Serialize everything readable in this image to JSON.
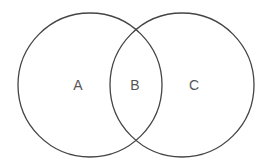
{
  "diagram": {
    "type": "venn",
    "stroke_color": "#444444",
    "label_color": "#555555",
    "circles": [
      {
        "name": "left",
        "cx": 90,
        "cy": 85,
        "r": 72
      },
      {
        "name": "right",
        "cx": 182,
        "cy": 85,
        "r": 72
      }
    ],
    "regions": [
      {
        "label": "A",
        "x": 78,
        "y": 85
      },
      {
        "label": "B",
        "x": 135,
        "y": 85
      },
      {
        "label": "C",
        "x": 194,
        "y": 85
      }
    ]
  }
}
